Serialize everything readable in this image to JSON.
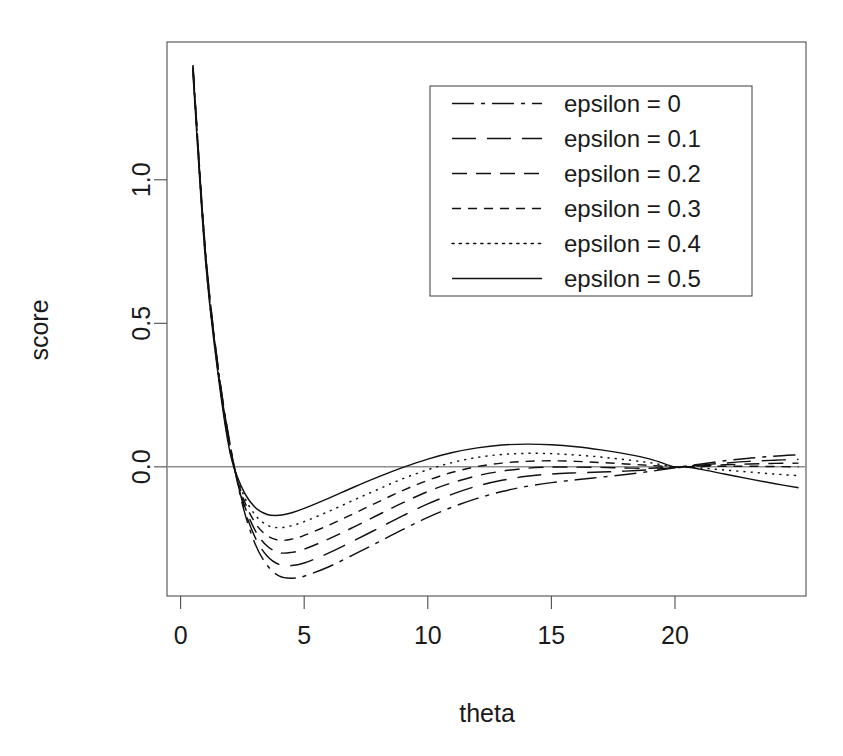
{
  "chart_data": {
    "type": "line",
    "title": "",
    "xlabel": "theta",
    "ylabel": "score",
    "xlim": [
      -0.55,
      25.3
    ],
    "ylim": [
      -0.45,
      1.48
    ],
    "xticks": [
      0,
      5,
      10,
      15,
      20
    ],
    "xticklabels": [
      "0",
      "5",
      "10",
      "15",
      "20"
    ],
    "yticks": [
      0.0,
      0.5,
      1.0
    ],
    "yticklabels": [
      "0.0",
      "0.5",
      "1.0"
    ],
    "grid": false,
    "zero_reference_line": 0.0,
    "legend_position": "top-right",
    "legend_entries": [
      "epsilon = 0",
      "epsilon = 0.1",
      "epsilon = 0.2",
      "epsilon = 0.3",
      "epsilon = 0.4",
      "epsilon = 0.5"
    ],
    "linestyles": [
      "dashdot",
      "longdash",
      "dash",
      "shortdash",
      "dotted",
      "solid"
    ],
    "dasharrays": [
      "22,7,4,7",
      "24,11",
      "15,9",
      "9,7",
      "2.2,5",
      "none"
    ],
    "line_color": "#111111",
    "x": [
      0.5,
      1.0,
      1.5,
      2.0,
      2.5,
      3.0,
      3.5,
      4.0,
      4.5,
      5.0,
      6.0,
      7.0,
      8.0,
      9.0,
      10.0,
      11.0,
      12.0,
      13.0,
      14.0,
      15.0,
      16.0,
      17.0,
      18.0,
      19.0,
      20.0,
      20.4,
      21.0,
      22.0,
      23.0,
      24.0,
      25.0
    ],
    "series": [
      {
        "name": "epsilon = 0",
        "linestyle": "dashdot",
        "values": [
          1.4,
          0.76,
          0.36,
          0.08,
          -0.13,
          -0.265,
          -0.343,
          -0.381,
          -0.388,
          -0.381,
          -0.348,
          -0.306,
          -0.262,
          -0.218,
          -0.176,
          -0.14,
          -0.11,
          -0.086,
          -0.068,
          -0.055,
          -0.045,
          -0.036,
          -0.027,
          -0.016,
          -0.003,
          0.002,
          0.009,
          0.021,
          0.03,
          0.037,
          0.042
        ]
      },
      {
        "name": "epsilon = 0.1",
        "linestyle": "longdash",
        "values": [
          1.395,
          0.755,
          0.357,
          0.076,
          -0.122,
          -0.243,
          -0.311,
          -0.341,
          -0.344,
          -0.335,
          -0.3,
          -0.258,
          -0.214,
          -0.17,
          -0.129,
          -0.095,
          -0.067,
          -0.047,
          -0.033,
          -0.025,
          -0.021,
          -0.018,
          -0.015,
          -0.01,
          -0.002,
          0.001,
          0.006,
          0.013,
          0.019,
          0.023,
          0.026
        ]
      },
      {
        "name": "epsilon = 0.2",
        "linestyle": "dash",
        "values": [
          1.39,
          0.748,
          0.352,
          0.07,
          -0.112,
          -0.219,
          -0.276,
          -0.299,
          -0.298,
          -0.287,
          -0.251,
          -0.21,
          -0.167,
          -0.125,
          -0.086,
          -0.055,
          -0.031,
          -0.015,
          -0.005,
          -0.001,
          -0.001,
          -0.002,
          -0.004,
          -0.005,
          -0.001,
          0.0,
          0.003,
          0.007,
          0.01,
          0.012,
          0.013
        ]
      },
      {
        "name": "epsilon = 0.3",
        "linestyle": "shortdash",
        "values": [
          1.385,
          0.742,
          0.346,
          0.064,
          -0.1,
          -0.193,
          -0.24,
          -0.256,
          -0.252,
          -0.239,
          -0.203,
          -0.163,
          -0.122,
          -0.082,
          -0.047,
          -0.019,
          0.001,
          0.013,
          0.019,
          0.021,
          0.019,
          0.015,
          0.01,
          0.005,
          -0.001,
          0.0,
          0.001,
          0.002,
          0.002,
          0.001,
          0.0
        ]
      },
      {
        "name": "epsilon = 0.4",
        "linestyle": "dotted",
        "values": [
          1.378,
          0.734,
          0.34,
          0.057,
          -0.088,
          -0.166,
          -0.203,
          -0.212,
          -0.205,
          -0.191,
          -0.155,
          -0.116,
          -0.078,
          -0.041,
          -0.01,
          0.015,
          0.033,
          0.043,
          0.047,
          0.046,
          0.041,
          0.034,
          0.025,
          0.014,
          -0.001,
          0.0,
          -0.004,
          -0.011,
          -0.018,
          -0.025,
          -0.031
        ]
      },
      {
        "name": "epsilon = 0.5",
        "linestyle": "solid",
        "values": [
          1.37,
          0.726,
          0.333,
          0.05,
          -0.076,
          -0.14,
          -0.166,
          -0.169,
          -0.16,
          -0.145,
          -0.109,
          -0.071,
          -0.035,
          -0.002,
          0.027,
          0.05,
          0.066,
          0.076,
          0.079,
          0.077,
          0.07,
          0.059,
          0.045,
          0.027,
          -0.001,
          0.0,
          -0.008,
          -0.025,
          -0.042,
          -0.058,
          -0.073
        ]
      }
    ]
  },
  "geometry": {
    "plot_left": 167,
    "plot_right": 806,
    "plot_top": 42,
    "plot_bottom": 596,
    "legend_x": 430,
    "legend_y": 86,
    "legend_w": 322,
    "legend_h": 210
  }
}
